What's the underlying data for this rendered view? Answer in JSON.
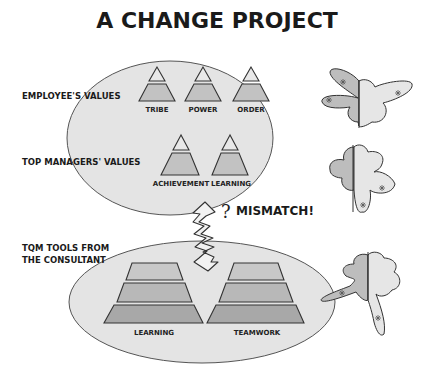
{
  "title": "A CHANGE PROJECT",
  "colors": {
    "ellipse_fill": "#e4e4e4",
    "pyramid_fill": "#c2c2c2",
    "pyramid_fill_dark": "#a8a8a8",
    "butterfly_light": "#e6e6e6",
    "butterfly_dark": "#bdbdbd",
    "stroke": "#333333"
  },
  "groups": [
    {
      "label": "EMPLOYEE'S VALUES",
      "pyramids": [
        "TRIBE",
        "POWER",
        "ORDER"
      ]
    },
    {
      "label": "TOP MANAGERS' VALUES",
      "pyramids": [
        "ACHIEVEMENT",
        "LEARNING"
      ]
    },
    {
      "label_line1": "TQM TOOLS FROM",
      "label_line2": "THE CONSULTANT",
      "pyramids": [
        "LEARNING",
        "TEAMWORK"
      ]
    }
  ],
  "annotation": {
    "question": "?",
    "mismatch": "MISMATCH!"
  }
}
